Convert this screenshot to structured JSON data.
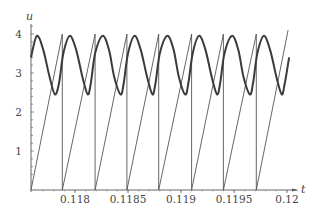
{
  "chart_data": {
    "type": "line",
    "title": "",
    "xlabel": "t",
    "ylabel": "u",
    "xlim": [
      0.117585,
      0.12015
    ],
    "ylim": [
      0,
      4.3
    ],
    "grid": false,
    "legend": null,
    "x_ticks": [
      0.118,
      0.1185,
      0.119,
      0.1195,
      0.12
    ],
    "x_tick_labels": [
      "0.118",
      "0.1185",
      "0.119",
      "0.1195",
      "0.12"
    ],
    "y_ticks": [
      1,
      2,
      3,
      4
    ],
    "y_tick_labels": [
      "1",
      "2",
      "3",
      "4"
    ],
    "series": [
      {
        "name": "oscillation (thick)",
        "style": "thick",
        "description": "periodic asymmetric wave, period ~0.000305, max ~3.95, min ~2.43",
        "period": 0.000305,
        "max": 3.95,
        "min": 2.43,
        "x": [
          0.117585,
          0.11764,
          0.1177,
          0.11776,
          0.11781,
          0.11785,
          0.11789,
          0.11795,
          0.11801,
          0.11807,
          0.11812,
          0.11815,
          0.11819,
          0.11826,
          0.11832,
          0.11837,
          0.11843,
          0.11846,
          0.1185,
          0.11856,
          0.11862,
          0.11868,
          0.11873,
          0.11876,
          0.1188,
          0.11887,
          0.11893,
          0.11898,
          0.11904,
          0.11907,
          0.11911,
          0.11917,
          0.11923,
          0.11929,
          0.11934,
          0.11937,
          0.11941,
          0.11948,
          0.11954,
          0.11959,
          0.11965,
          0.11968,
          0.11972,
          0.11978,
          0.11984,
          0.1199,
          0.11995,
          0.11998,
          0.12002
        ],
        "y": [
          3.4,
          3.95,
          3.6,
          2.9,
          2.45,
          2.75,
          3.5,
          3.95,
          3.6,
          2.9,
          2.45,
          2.75,
          3.5,
          3.95,
          3.6,
          2.9,
          2.45,
          2.75,
          3.5,
          3.95,
          3.6,
          2.9,
          2.45,
          2.75,
          3.5,
          3.95,
          3.6,
          2.9,
          2.45,
          2.75,
          3.5,
          3.95,
          3.6,
          2.9,
          2.45,
          2.75,
          3.5,
          3.95,
          3.6,
          2.9,
          2.45,
          2.75,
          3.5,
          3.95,
          3.6,
          2.9,
          2.45,
          2.75,
          3.4
        ]
      },
      {
        "name": "sawtooth (thin)",
        "style": "thin",
        "description": "linear ramp 0 to ~4, vertical reset to 0 each period",
        "reset_times": [
          0.11788,
          0.11819,
          0.11849,
          0.11879,
          0.1191,
          0.1194,
          0.11971
        ],
        "peak_value": 4.0,
        "final_value": 4.1,
        "x": [
          0.117585,
          0.11788,
          0.11788,
          0.11819,
          0.11819,
          0.11849,
          0.11849,
          0.11879,
          0.11879,
          0.1191,
          0.1191,
          0.1194,
          0.1194,
          0.11971,
          0.11971,
          0.12001
        ],
        "y": [
          0,
          4.0,
          0,
          4.0,
          0,
          4.0,
          0,
          4.0,
          0,
          4.0,
          0,
          4.0,
          0,
          4.0,
          0,
          4.1
        ]
      }
    ]
  }
}
